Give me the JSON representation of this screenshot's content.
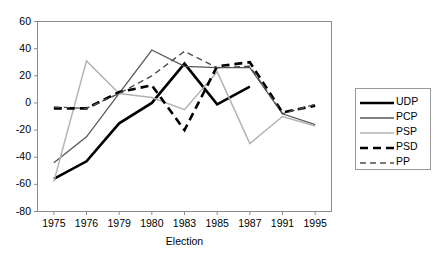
{
  "chart_data": {
    "type": "line",
    "title": "",
    "xlabel": "Election",
    "ylabel": "",
    "categories": [
      "1975",
      "1976",
      "1979",
      "1980",
      "1983",
      "1985",
      "1987",
      "1991",
      "1995"
    ],
    "ylim": [
      -80,
      60
    ],
    "ytick_values": [
      60,
      40,
      20,
      0,
      -20,
      -40,
      -60,
      -80
    ],
    "ytick_labels": [
      "60",
      "40",
      "20",
      "0",
      "-20",
      "-40",
      "-60",
      "-80"
    ],
    "grid": false,
    "legend_position": "right",
    "series": [
      {
        "name": "UDP",
        "color": "#000000",
        "style": "solid",
        "width": 2.6,
        "values": [
          -56,
          -43,
          -15,
          0,
          29,
          -1,
          12,
          null,
          null
        ]
      },
      {
        "name": "PCP",
        "color": "#595959",
        "style": "solid",
        "width": 1.3,
        "values": [
          -44,
          -25,
          7,
          39,
          27,
          26,
          26,
          -8,
          -16
        ]
      },
      {
        "name": "PSP",
        "color": "#b3b3b3",
        "style": "solid",
        "width": 1.5,
        "values": [
          -58,
          31,
          7,
          4,
          -5,
          23,
          -30,
          -10,
          -17
        ]
      },
      {
        "name": "PSD",
        "color": "#000000",
        "style": "dashed",
        "width": 2.6,
        "values": [
          -4,
          -4,
          8,
          13,
          -20,
          27,
          30,
          -7,
          -2
        ]
      },
      {
        "name": "PP",
        "color": "#4d4d4d",
        "style": "dashed",
        "width": 1.4,
        "values": [
          -3,
          -4,
          7,
          20,
          38,
          26,
          27,
          -8,
          -1
        ]
      }
    ]
  },
  "legend": {
    "entries": [
      "UDP",
      "PCP",
      "PSP",
      "PSD",
      "PP"
    ]
  },
  "axes": {
    "x_title": "Election"
  }
}
